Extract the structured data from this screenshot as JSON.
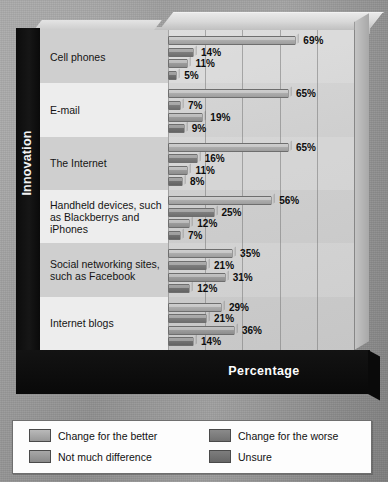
{
  "axis": {
    "y_title": "Innovation",
    "x_title": "Percentage"
  },
  "x_ticks": [
    "0%",
    "20%",
    "40%",
    "60%",
    "80%",
    "100%"
  ],
  "legend": {
    "items": [
      {
        "label": "Change for the better",
        "color": "#b9b9b9"
      },
      {
        "label": "Change for the worse",
        "color": "#8a8a8a"
      },
      {
        "label": "Not much difference",
        "color": "#a8a8a8"
      },
      {
        "label": "Unsure",
        "color": "#7d7d7d"
      }
    ]
  },
  "chart_data": {
    "type": "bar",
    "orientation": "horizontal",
    "title": "",
    "xlabel": "Percentage",
    "ylabel": "Innovation",
    "xlim": [
      0,
      100
    ],
    "xticks": [
      0,
      20,
      40,
      60,
      80,
      100
    ],
    "grid": true,
    "legend_position": "bottom",
    "categories": [
      "Cell phones",
      "E-mail",
      "The Internet",
      "Handheld devices, such as Blackberrys and iPhones",
      "Social networking sites, such as Facebook",
      "Internet blogs"
    ],
    "series": [
      {
        "name": "Change for the better",
        "values": [
          69,
          65,
          65,
          56,
          35,
          29
        ]
      },
      {
        "name": "Change for the worse",
        "values": [
          14,
          7,
          16,
          25,
          21,
          21
        ]
      },
      {
        "name": "Not much difference",
        "values": [
          11,
          19,
          11,
          12,
          31,
          36
        ]
      },
      {
        "name": "Unsure",
        "values": [
          5,
          9,
          8,
          7,
          12,
          14
        ]
      }
    ],
    "value_labels": [
      [
        "69%",
        "14%",
        "11%",
        "5%"
      ],
      [
        "65%",
        "7%",
        "19%",
        "9%"
      ],
      [
        "65%",
        "16%",
        "11%",
        "8%"
      ],
      [
        "56%",
        "25%",
        "12%",
        "7%"
      ],
      [
        "35%",
        "21%",
        "31%",
        "12%"
      ],
      [
        "29%",
        "21%",
        "36%",
        "14%"
      ]
    ]
  },
  "category_lines": [
    [
      "Cell phones"
    ],
    [
      "E-mail"
    ],
    [
      "The Internet"
    ],
    [
      "Handheld devices, such",
      "as Blackberrys and",
      "iPhones"
    ],
    [
      "Social networking sites,",
      "such as Facebook"
    ],
    [
      "Internet blogs"
    ]
  ]
}
